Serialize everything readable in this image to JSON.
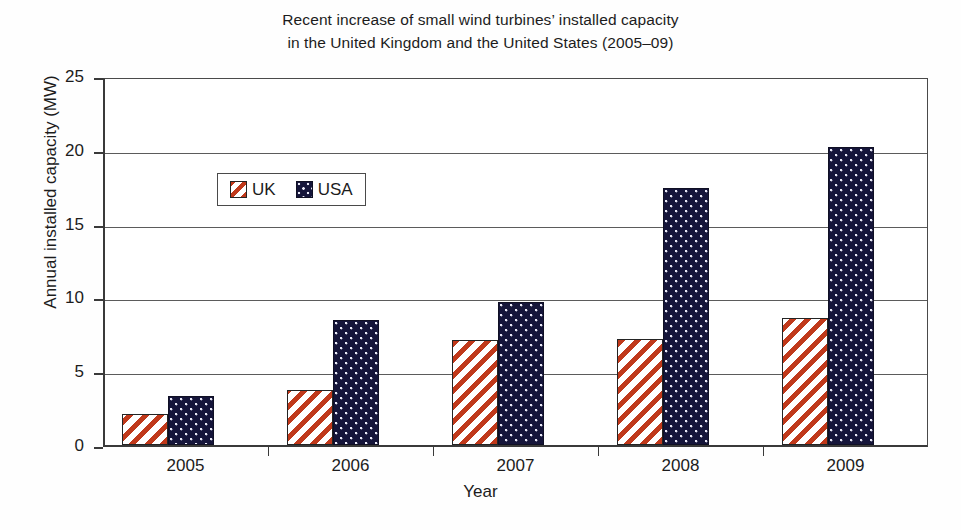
{
  "chart_data": {
    "type": "bar",
    "title_line1": "Recent increase of small wind turbines’ installed capacity",
    "title_line2": "in the United Kingdom and the United States (2005–09)",
    "xlabel": "Year",
    "ylabel": "Annual installed capacity (MW)",
    "categories": [
      "2005",
      "2006",
      "2007",
      "2008",
      "2009"
    ],
    "series": [
      {
        "name": "UK",
        "values": [
          2.1,
          3.7,
          7.1,
          7.2,
          8.6
        ],
        "color": "#c0391b",
        "pattern": "diagonal-hatch"
      },
      {
        "name": "USA",
        "values": [
          3.3,
          8.5,
          9.7,
          17.4,
          20.2
        ],
        "color": "#15153a",
        "pattern": "dotted"
      }
    ],
    "ylim": [
      0,
      25
    ],
    "yticks": [
      0,
      5,
      10,
      15,
      20,
      25
    ],
    "ytick_labels": [
      "0",
      "5",
      "10",
      "15",
      "20",
      "25"
    ],
    "grid": true,
    "grid_axis": "y",
    "legend_position": "top-left"
  },
  "legend": {
    "items": [
      {
        "label": "UK",
        "swatch": "uk-swatch-icon"
      },
      {
        "label": "USA",
        "swatch": "usa-swatch-icon"
      }
    ]
  },
  "caption": {
    "fragment": ""
  }
}
